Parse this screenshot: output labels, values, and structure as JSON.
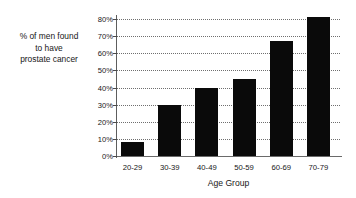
{
  "chart_data": {
    "type": "bar",
    "title": "",
    "categories": [
      "20-29",
      "30-39",
      "40-49",
      "50-59",
      "60-69",
      "70-79"
    ],
    "values": [
      8,
      30,
      40,
      45,
      67,
      81
    ],
    "xlabel": "Age Group",
    "ylabel": "% of men found to have prostate cancer",
    "ylabel_lines": [
      "% of men found",
      "to have",
      "prostate cancer"
    ],
    "ylim": [
      0,
      80
    ],
    "ytick_labels": [
      "0%",
      "10%",
      "20%",
      "30%",
      "40%",
      "50%",
      "60%",
      "70%",
      "80%"
    ],
    "ytick_values": [
      0,
      10,
      20,
      30,
      40,
      50,
      60,
      70,
      80
    ],
    "grid": "horizontal-dotted",
    "legend": "none",
    "bar_color": "#0a0a0a",
    "gridline_color": "#6f6f6f",
    "axis_color": "#6a6a6a",
    "background_color": "#ffffff"
  }
}
